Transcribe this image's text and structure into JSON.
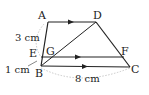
{
  "diagram": {
    "points": {
      "A": "A",
      "B": "B",
      "C": "C",
      "D": "D",
      "E": "E",
      "F": "F",
      "G": "G"
    },
    "measures": {
      "AE": "3 cm",
      "EB": "1 cm",
      "BC": "8 cm"
    },
    "colors": {
      "line": "#222222",
      "dotted": "#bbbbbb"
    }
  }
}
